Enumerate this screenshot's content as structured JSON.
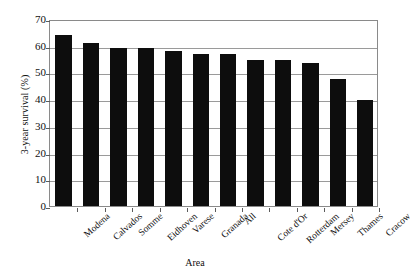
{
  "chart_data": {
    "type": "bar",
    "title": "",
    "xlabel": "Area",
    "ylabel": "3-year survival (%)",
    "ylim": [
      0,
      70
    ],
    "ytick_step": 10,
    "yticks": [
      "70",
      "60",
      "50",
      "40",
      "30",
      "20",
      "10",
      "0"
    ],
    "grid": true,
    "legend": "none",
    "bar_color": "#0d0d0d",
    "categories": [
      "Modena",
      "Calvados",
      "Somme",
      "Eidhoven",
      "Varese",
      "Granada",
      "All",
      "Cote d'Or",
      "Rotterdam",
      "Mersey",
      "Thames",
      "Cracow"
    ],
    "values": [
      64,
      61,
      59,
      59,
      58,
      57,
      57,
      54.5,
      54.5,
      53.5,
      47.5,
      39.5
    ]
  },
  "axes": {
    "y_title": "3-year survival (%)",
    "x_title": "Area"
  }
}
